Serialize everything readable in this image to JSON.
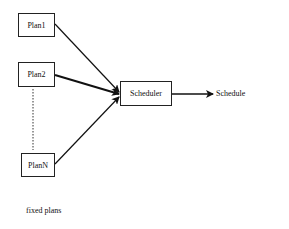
{
  "diagram": {
    "inputs": [
      {
        "id": "plan1",
        "label": "Plan1"
      },
      {
        "id": "plan2",
        "label": "Plan2"
      },
      {
        "id": "planN",
        "label": "PlanN"
      }
    ],
    "processor": {
      "label": "Scheduler"
    },
    "output": {
      "label": "Schedule"
    },
    "caption": "fixed plans",
    "edges": [
      {
        "from": "Plan1",
        "to": "Scheduler"
      },
      {
        "from": "Plan2",
        "to": "Scheduler",
        "style": "bold"
      },
      {
        "from": "PlanN",
        "to": "Scheduler"
      },
      {
        "from": "Scheduler",
        "to": "Schedule"
      }
    ],
    "ellipsis": "dotted line between Plan2 and PlanN"
  }
}
